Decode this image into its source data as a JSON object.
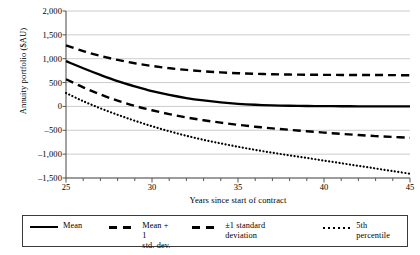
{
  "chart_data": {
    "type": "line",
    "title": "",
    "xlabel": "Years since start of contract",
    "ylabel": "Annuity portfolio ($AU)",
    "xlim": [
      25,
      45
    ],
    "ylim": [
      -1500,
      2000
    ],
    "xticks": [
      25,
      30,
      35,
      40,
      45
    ],
    "xtick_labels": [
      "25",
      "30",
      "35",
      "40",
      "45"
    ],
    "x_minor_tick_step": 1,
    "yticks": [
      2000,
      1500,
      1000,
      500,
      0,
      -500,
      -1000,
      -1500
    ],
    "ytick_labels": [
      "2,000",
      "1,500",
      "1,000",
      "500",
      "0",
      "–500",
      "–1,000",
      "–1,500"
    ],
    "grid": "horizontal",
    "legend_position": "below-axes",
    "x": [
      25,
      26,
      27,
      28,
      29,
      30,
      31,
      32,
      33,
      34,
      35,
      36,
      37,
      38,
      39,
      40,
      41,
      42,
      43,
      44,
      45
    ],
    "series": [
      {
        "name": "Mean",
        "style": "solid",
        "values": [
          950,
          800,
          660,
          530,
          420,
          320,
          240,
          175,
          125,
          85,
          55,
          35,
          22,
          14,
          9,
          6,
          4,
          3,
          2,
          1,
          0
        ]
      },
      {
        "name": "Mean + 1 std. dev.",
        "style": "dashed",
        "values": [
          1280,
          1160,
          1060,
          975,
          905,
          848,
          802,
          765,
          736,
          713,
          696,
          683,
          674,
          668,
          664,
          662,
          660,
          659,
          658,
          656,
          652
        ]
      },
      {
        "name": "±1 standard deviation",
        "style": "dashed",
        "values": [
          570,
          400,
          250,
          120,
          10,
          -80,
          -160,
          -230,
          -290,
          -340,
          -385,
          -425,
          -460,
          -490,
          -520,
          -548,
          -575,
          -600,
          -622,
          -640,
          -655
        ]
      },
      {
        "name": "5th percentile",
        "style": "dotted",
        "values": [
          280,
          110,
          -40,
          -175,
          -300,
          -415,
          -520,
          -615,
          -700,
          -775,
          -845,
          -910,
          -970,
          -1025,
          -1080,
          -1135,
          -1190,
          -1245,
          -1300,
          -1355,
          -1410
        ]
      }
    ]
  },
  "legend": {
    "items": [
      {
        "label": "Mean",
        "key": "solid"
      },
      {
        "label": "Mean + 1\nstd. dev.",
        "key": "dashed"
      },
      {
        "label": "±1 standard deviation",
        "key": "dashed"
      },
      {
        "label": "5th percentile",
        "key": "dotted"
      }
    ]
  }
}
